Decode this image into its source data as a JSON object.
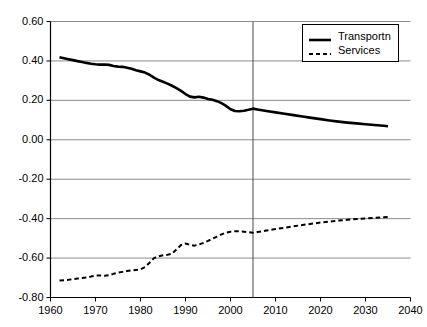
{
  "chart_data": {
    "type": "line",
    "title": "",
    "xlabel": "",
    "ylabel": "",
    "xlim": [
      1960,
      2040
    ],
    "ylim": [
      -0.8,
      0.6
    ],
    "grid": "horizontal",
    "legend_position": "top-right",
    "x_ticks": [
      1960,
      1970,
      1980,
      1990,
      2000,
      2010,
      2020,
      2030,
      2040
    ],
    "x_tick_labels": [
      "1960",
      "1970",
      "1980",
      "1990",
      "2000",
      "2010",
      "2020",
      "2030",
      "2040"
    ],
    "y_ticks": [
      0.6,
      0.4,
      0.2,
      0.0,
      -0.2,
      -0.4,
      -0.6,
      -0.8
    ],
    "y_tick_labels": [
      "0.60",
      "0.40",
      "0.20",
      "0.00",
      "-0.20",
      "-0.40",
      "-0.60",
      "-0.80"
    ],
    "annotations": [
      {
        "name": "projection-divider",
        "type": "vertical-line",
        "x": 2005
      }
    ],
    "series": [
      {
        "name": "Transportn",
        "style": "solid",
        "color": "#000000",
        "width": 2.6,
        "points": [
          [
            1962,
            0.419
          ],
          [
            1963,
            0.414
          ],
          [
            1964,
            0.409
          ],
          [
            1965,
            0.404
          ],
          [
            1966,
            0.399
          ],
          [
            1967,
            0.395
          ],
          [
            1968,
            0.39
          ],
          [
            1969,
            0.386
          ],
          [
            1970,
            0.383
          ],
          [
            1971,
            0.381
          ],
          [
            1972,
            0.382
          ],
          [
            1973,
            0.38
          ],
          [
            1974,
            0.374
          ],
          [
            1975,
            0.371
          ],
          [
            1976,
            0.37
          ],
          [
            1977,
            0.365
          ],
          [
            1978,
            0.36
          ],
          [
            1979,
            0.353
          ],
          [
            1980,
            0.347
          ],
          [
            1981,
            0.341
          ],
          [
            1982,
            0.33
          ],
          [
            1983,
            0.315
          ],
          [
            1984,
            0.303
          ],
          [
            1985,
            0.294
          ],
          [
            1986,
            0.285
          ],
          [
            1987,
            0.274
          ],
          [
            1988,
            0.262
          ],
          [
            1989,
            0.248
          ],
          [
            1990,
            0.232
          ],
          [
            1991,
            0.219
          ],
          [
            1992,
            0.215
          ],
          [
            1993,
            0.218
          ],
          [
            1994,
            0.214
          ],
          [
            1995,
            0.207
          ],
          [
            1996,
            0.203
          ],
          [
            1997,
            0.196
          ],
          [
            1998,
            0.186
          ],
          [
            1999,
            0.172
          ],
          [
            2000,
            0.155
          ],
          [
            2001,
            0.146
          ],
          [
            2002,
            0.145
          ],
          [
            2003,
            0.147
          ],
          [
            2004,
            0.152
          ],
          [
            2005,
            0.158
          ],
          [
            2006,
            0.154
          ],
          [
            2008,
            0.146
          ],
          [
            2010,
            0.139
          ],
          [
            2012,
            0.132
          ],
          [
            2014,
            0.125
          ],
          [
            2016,
            0.118
          ],
          [
            2018,
            0.111
          ],
          [
            2020,
            0.105
          ],
          [
            2022,
            0.098
          ],
          [
            2024,
            0.092
          ],
          [
            2026,
            0.087
          ],
          [
            2028,
            0.083
          ],
          [
            2030,
            0.079
          ],
          [
            2032,
            0.075
          ],
          [
            2034,
            0.071
          ],
          [
            2035,
            0.069
          ]
        ]
      },
      {
        "name": "Services",
        "style": "dashed",
        "color": "#000000",
        "width": 2.0,
        "points": [
          [
            1962,
            -0.714
          ],
          [
            1963,
            -0.712
          ],
          [
            1964,
            -0.71
          ],
          [
            1965,
            -0.707
          ],
          [
            1966,
            -0.704
          ],
          [
            1967,
            -0.701
          ],
          [
            1968,
            -0.698
          ],
          [
            1969,
            -0.694
          ],
          [
            1970,
            -0.689
          ],
          [
            1971,
            -0.688
          ],
          [
            1972,
            -0.69
          ],
          [
            1973,
            -0.687
          ],
          [
            1974,
            -0.68
          ],
          [
            1975,
            -0.674
          ],
          [
            1976,
            -0.67
          ],
          [
            1977,
            -0.666
          ],
          [
            1978,
            -0.663
          ],
          [
            1979,
            -0.66
          ],
          [
            1980,
            -0.657
          ],
          [
            1981,
            -0.646
          ],
          [
            1982,
            -0.624
          ],
          [
            1983,
            -0.6
          ],
          [
            1984,
            -0.591
          ],
          [
            1985,
            -0.586
          ],
          [
            1986,
            -0.583
          ],
          [
            1987,
            -0.578
          ],
          [
            1988,
            -0.556
          ],
          [
            1989,
            -0.534
          ],
          [
            1990,
            -0.526
          ],
          [
            1991,
            -0.533
          ],
          [
            1992,
            -0.537
          ],
          [
            1993,
            -0.531
          ],
          [
            1994,
            -0.523
          ],
          [
            1995,
            -0.513
          ],
          [
            1996,
            -0.502
          ],
          [
            1997,
            -0.491
          ],
          [
            1998,
            -0.48
          ],
          [
            1999,
            -0.471
          ],
          [
            2000,
            -0.466
          ],
          [
            2001,
            -0.464
          ],
          [
            2002,
            -0.464
          ],
          [
            2003,
            -0.466
          ],
          [
            2004,
            -0.469
          ],
          [
            2005,
            -0.472
          ],
          [
            2006,
            -0.468
          ],
          [
            2008,
            -0.46
          ],
          [
            2010,
            -0.453
          ],
          [
            2012,
            -0.446
          ],
          [
            2014,
            -0.439
          ],
          [
            2016,
            -0.432
          ],
          [
            2018,
            -0.426
          ],
          [
            2020,
            -0.42
          ],
          [
            2022,
            -0.415
          ],
          [
            2024,
            -0.41
          ],
          [
            2026,
            -0.406
          ],
          [
            2028,
            -0.402
          ],
          [
            2030,
            -0.399
          ],
          [
            2032,
            -0.396
          ],
          [
            2034,
            -0.393
          ],
          [
            2035,
            -0.392
          ]
        ]
      }
    ]
  },
  "legend": {
    "items": [
      {
        "label": "Transportn",
        "style": "solid"
      },
      {
        "label": "Services",
        "style": "dashed"
      }
    ]
  },
  "colors": {
    "line": "#000000",
    "grid": "#8c8c8c",
    "axis": "#000000",
    "background": "#ffffff"
  }
}
